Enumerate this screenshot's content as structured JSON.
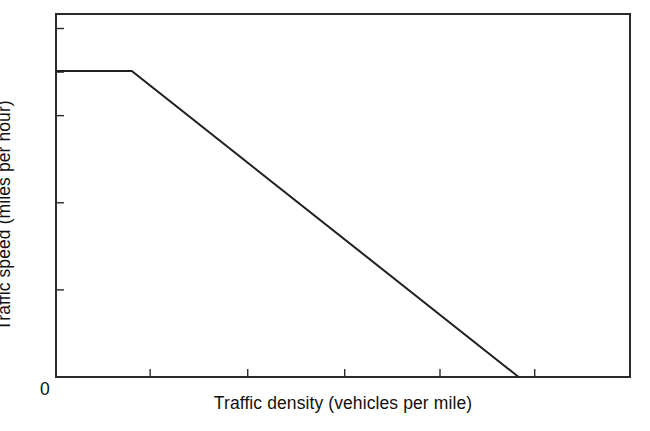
{
  "chart_data": {
    "type": "line",
    "title": "",
    "subtitle": "",
    "xlabel": "Traffic density (vehicles per mile)",
    "ylabel": "Traffic speed (miles per hour)",
    "grid": false,
    "legend": false,
    "legend_position": "none",
    "xlim": [
      0,
      100
    ],
    "ylim": [
      0,
      70
    ],
    "xtick_labels": [
      "0"
    ],
    "ytick_labels": [],
    "x_tick_values": [
      16.4,
      33.4,
      50.3,
      66.9,
      83.4
    ],
    "y_tick_values": [
      16.8,
      33.6,
      50.4,
      58.8,
      67.2
    ],
    "annotations": [],
    "series": [
      {
        "name": "Speed-density relationship",
        "color": "#1f1f1f",
        "x": [
          0,
          13.2,
          80.6
        ],
        "y": [
          59,
          59,
          0
        ],
        "description": "Free-flow speed constant until critical density, then linear decline to zero speed at jam density"
      }
    ],
    "free_flow_speed": 59,
    "critical_density": 13.2,
    "jam_density": 80.6
  },
  "figure": {
    "origin_label": "0",
    "background_color": "#ffffff",
    "line_color": "#1f1f1f",
    "axis_color": "#2b2b2b"
  }
}
